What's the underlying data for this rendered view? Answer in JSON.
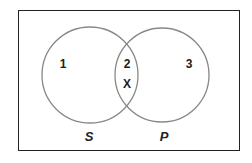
{
  "diagram": {
    "type": "venn",
    "frame": {
      "label": "universe"
    },
    "sets": [
      {
        "id": "S",
        "label": "S"
      },
      {
        "id": "P",
        "label": "P"
      }
    ],
    "regions": [
      {
        "id": "1",
        "label": "1",
        "description": "S only"
      },
      {
        "id": "2",
        "label": "2",
        "description": "S and P"
      },
      {
        "id": "3",
        "label": "3",
        "description": "P only"
      }
    ],
    "marks": [
      {
        "label": "X",
        "region": "2"
      }
    ],
    "colors": {
      "frame": "#222222",
      "circle_stroke": "#888888",
      "text": "#222222"
    }
  }
}
